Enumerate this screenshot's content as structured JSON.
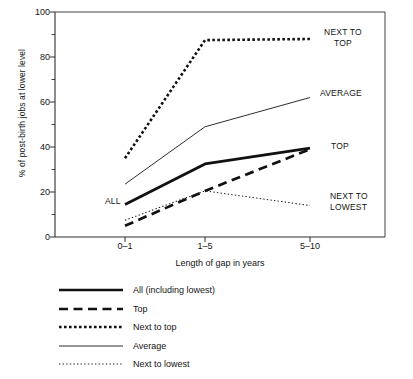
{
  "chart_data": {
    "type": "line",
    "title": "",
    "xlabel": "Length of gap in years",
    "ylabel": "% of post-birth jobs at lower level",
    "categories": [
      "0–1",
      "1–5",
      "5–10"
    ],
    "ylim": [
      0,
      100
    ],
    "yticks": [
      0,
      20,
      40,
      60,
      80,
      100
    ],
    "yticks_minor": [
      10,
      30,
      50,
      70,
      90
    ],
    "grid": false,
    "legend_position": "below-left",
    "series": [
      {
        "name": "All (including lowest)",
        "style": "solid-thick",
        "annotation": "ALL",
        "values": [
          14.5,
          32.5,
          39.5
        ]
      },
      {
        "name": "Top",
        "style": "dashed-thick",
        "annotation": "TOP",
        "values": [
          5,
          20.5,
          39
        ]
      },
      {
        "name": "Next to top",
        "style": "dotted-thick",
        "annotation": "NEXT TO\nTOP",
        "values": [
          35,
          87.5,
          88
        ]
      },
      {
        "name": "Average",
        "style": "solid-thin",
        "annotation": "AVERAGE",
        "values": [
          23.5,
          49,
          62
        ]
      },
      {
        "name": "Next to lowest",
        "style": "dotted-thin",
        "annotation": "NEXT TO\nLOWEST",
        "values": [
          7.5,
          20.5,
          14
        ]
      }
    ]
  },
  "axes": {
    "y_tick_labels": [
      "0",
      "20",
      "40",
      "60",
      "80",
      "100"
    ],
    "x_tick_labels": [
      "0–1",
      "1–5",
      "5–10"
    ],
    "x_title": "Length of gap in years",
    "y_title": "% of post-birth jobs at lower level"
  },
  "annotations": {
    "all": "ALL",
    "top": "TOP",
    "next_to_top_line1": "NEXT TO",
    "next_to_top_line2": "TOP",
    "average": "AVERAGE",
    "next_to_lowest_line1": "NEXT TO",
    "next_to_lowest_line2": "LOWEST"
  },
  "legend": {
    "items": [
      {
        "label": "All (including lowest)",
        "swatch": "solid-thick-line-icon"
      },
      {
        "label": "Top",
        "swatch": "dashed-thick-line-icon"
      },
      {
        "label": "Next to top",
        "swatch": "dotted-thick-line-icon"
      },
      {
        "label": "Average",
        "swatch": "solid-thin-line-icon"
      },
      {
        "label": "Next to lowest",
        "swatch": "dotted-thin-line-icon"
      }
    ]
  },
  "colors": {
    "ink": "#141414",
    "axis": "#3a3a3a",
    "background": "#ffffff"
  }
}
